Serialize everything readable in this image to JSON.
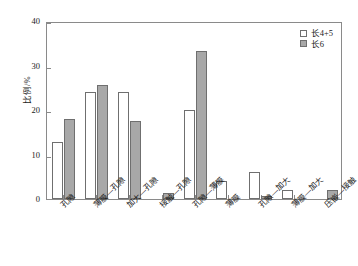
{
  "chart_data": {
    "type": "bar",
    "title": "",
    "xlabel": "",
    "ylabel": "比例/%",
    "ylim": [
      0,
      40
    ],
    "yticks": [
      0,
      10,
      20,
      30,
      40
    ],
    "ytick_labels": [
      "0",
      "10",
      "20",
      "30",
      "40"
    ],
    "grid": false,
    "legend_position": "top-right",
    "categories": [
      "孔隙",
      "薄膜—孔隙",
      "加大—孔隙",
      "接触—孔隙",
      "孔隙—薄膜",
      "薄膜",
      "孔隙—加大",
      "薄膜—加大",
      "压嵌—接触"
    ],
    "series": [
      {
        "name": "长4+5",
        "color": "#ffffff",
        "values": [
          12.8,
          24.0,
          24.0,
          0.0,
          20.0,
          4.0,
          6.0,
          2.0,
          0.0
        ]
      },
      {
        "name": "长6",
        "color": "#a8a8a8",
        "values": [
          18.0,
          25.7,
          17.5,
          1.3,
          33.3,
          0.0,
          0.7,
          0.0,
          2.0
        ]
      }
    ]
  },
  "legend": {
    "entries": [
      {
        "label": "长4+5"
      },
      {
        "label": "长6"
      }
    ]
  }
}
